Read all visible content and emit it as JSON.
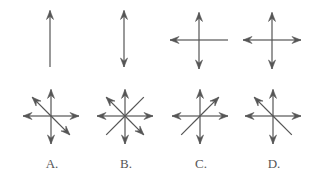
{
  "stroke_color": "#555555",
  "top_row": [
    {
      "id": "fig1",
      "cx": 50,
      "cy": 38,
      "arrows": [
        "up"
      ],
      "plain_ends": [
        "down"
      ]
    },
    {
      "id": "fig2",
      "cx": 124,
      "cy": 38,
      "arrows": [
        "up",
        "down"
      ],
      "plain_ends": []
    },
    {
      "id": "fig3",
      "cx": 199,
      "cy": 40,
      "arrows": [
        "up",
        "down",
        "left"
      ],
      "plain_ends": [
        "right"
      ]
    },
    {
      "id": "fig4",
      "cx": 272,
      "cy": 40,
      "arrows": [
        "up",
        "down",
        "left",
        "right"
      ],
      "plain_ends": []
    }
  ],
  "options": [
    {
      "label": "A.",
      "cx": 51,
      "cy": 116,
      "arrows": [
        "up",
        "down",
        "left",
        "right",
        "nw",
        "se"
      ],
      "plain_ends": []
    },
    {
      "label": "B.",
      "cx": 125,
      "cy": 116,
      "arrows": [
        "up",
        "down",
        "left",
        "right",
        "nw",
        "se"
      ],
      "plain_ends": [
        "ne",
        "sw"
      ]
    },
    {
      "label": "C.",
      "cx": 200,
      "cy": 116,
      "arrows": [
        "up",
        "down",
        "left",
        "right",
        "ne"
      ],
      "plain_ends": [
        "sw"
      ]
    },
    {
      "label": "D.",
      "cx": 273,
      "cy": 116,
      "arrows": [
        "up",
        "down",
        "left",
        "right",
        "nw"
      ],
      "plain_ends": [
        "se"
      ]
    }
  ]
}
